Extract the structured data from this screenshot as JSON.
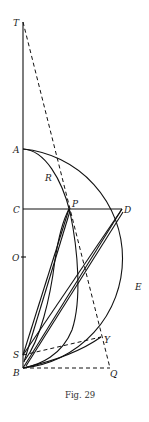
{
  "caption": "Fig. 29",
  "labels": {
    "T": "T",
    "A": "A",
    "R": "R",
    "C": "C",
    "P": "P",
    "D": "D",
    "O": "O",
    "E": "E",
    "Y": "Y",
    "S": "S",
    "B": "B",
    "Q": "Q"
  },
  "colors": {
    "ink": "#111111",
    "background": "#ffffff"
  }
}
